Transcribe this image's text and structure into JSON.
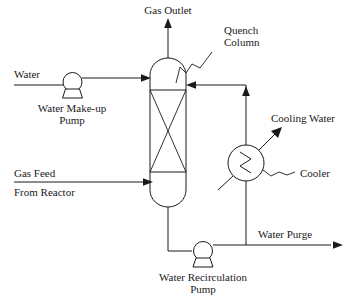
{
  "diagram": {
    "type": "process-flow-diagram",
    "colors": {
      "line": "#1a1a1a",
      "background": "#ffffff",
      "fill": "#ffffff"
    },
    "labels": {
      "gas_outlet": "Gas Outlet",
      "quench_column_line1": "Quench",
      "quench_column_line2": "Column",
      "water": "Water",
      "water_makeup_pump_line1": "Water Make-up",
      "water_makeup_pump_line2": "Pump",
      "gas_feed_line1": "Gas Feed",
      "gas_feed_line2": "From Reactor",
      "cooling_water": "Cooling Water",
      "cooler": "Cooler",
      "water_purge": "Water Purge",
      "water_recirculation_pump_line1": "Water Recirculation",
      "water_recirculation_pump_line2": "Pump"
    },
    "equipment": [
      {
        "id": "quench-column",
        "name": "Quench Column",
        "symbol": "packed-column-vessel",
        "description": "Vertical capsule vessel with packed bed section marked by an X"
      },
      {
        "id": "water-makeup-pump",
        "name": "Water Make-up Pump",
        "symbol": "centrifugal-pump"
      },
      {
        "id": "cooler",
        "name": "Cooler",
        "symbol": "heat-exchanger-zigzag"
      },
      {
        "id": "water-recirculation-pump",
        "name": "Water Recirculation Pump",
        "symbol": "centrifugal-pump"
      }
    ],
    "streams": [
      {
        "id": "gas-outlet",
        "name": "Gas Outlet",
        "direction": "up",
        "from": "quench-column-top"
      },
      {
        "id": "water-inlet",
        "name": "Water",
        "direction": "right",
        "to": "quench-column-upper"
      },
      {
        "id": "gas-feed",
        "name": "Gas Feed From Reactor",
        "direction": "right",
        "to": "quench-column-lower"
      },
      {
        "id": "cooling-water",
        "name": "Cooling Water",
        "direction": "up-right",
        "from": "cooler"
      },
      {
        "id": "water-purge",
        "name": "Water Purge",
        "direction": "right",
        "from": "recirculation-line"
      },
      {
        "id": "recirculation",
        "name": "Recirculated Water",
        "direction": "up-then-left",
        "to": "quench-column-upper"
      }
    ]
  }
}
